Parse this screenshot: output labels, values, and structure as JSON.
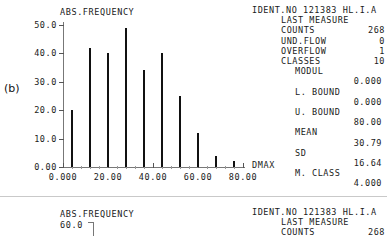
{
  "figure_label": "(b)",
  "panel_b": {
    "y_axis_title": "ABS.FREQUENCY",
    "x_axis_title": "DMAX",
    "y_ticks": [
      "50.0",
      "40.0",
      "30.0",
      "20.0",
      "10.0",
      "0.00"
    ],
    "x_ticks": [
      "0.000",
      "20.00",
      "40.00",
      "60.00",
      "80.00"
    ],
    "stats": {
      "ident_line": "IDENT.NO 121383 HL.I.A",
      "last_measure": "LAST MEASURE",
      "counts_label": "COUNTS",
      "counts_value": "268",
      "underflow_label": "UND.FLOW",
      "underflow_value": "0",
      "overflow_label": "OVERFLOW",
      "overflow_value": "1",
      "classes_label": "CLASSES",
      "classes_value": "10",
      "modul_label": "MODUL",
      "modul_value": "0.000",
      "lbound_label": "L. BOUND",
      "lbound_value": "0.000",
      "ubound_label": "U. BOUND",
      "ubound_value": "80.00",
      "mean_label": "MEAN",
      "mean_value": "30.79",
      "sd_label": "SD",
      "sd_value": "16.64",
      "mclass_label": "M. CLASS",
      "mclass_value": "4.000"
    }
  },
  "panel_c": {
    "y_axis_title": "ABS.FREQUENCY",
    "y_top_tick": "60.0",
    "stats": {
      "ident_line": "IDENT.NO 121383 HL.I.A",
      "last_measure": "LAST MEASURE",
      "counts_label": "COUNTS",
      "counts_value": "268"
    }
  },
  "chart_data": {
    "type": "bar",
    "title": "",
    "xlabel": "DMAX",
    "ylabel": "ABS.FREQUENCY",
    "categories": [
      "4.000",
      "12.00",
      "20.00",
      "28.00",
      "36.00",
      "44.00",
      "52.00",
      "60.00",
      "68.00",
      "76.00"
    ],
    "x": [
      4,
      12,
      20,
      28,
      36,
      44,
      52,
      60,
      68,
      76
    ],
    "values": [
      20,
      42,
      40,
      49,
      34,
      40,
      25,
      12,
      4,
      2
    ],
    "xlim": [
      0,
      80
    ],
    "ylim": [
      0,
      50
    ],
    "xticks": [
      0,
      20,
      40,
      60,
      80
    ],
    "xticklabels": [
      "0.000",
      "20.00",
      "40.00",
      "60.00",
      "80.00"
    ],
    "yticks": [
      0,
      10,
      20,
      30,
      40,
      50
    ],
    "yticklabels": [
      "0.00",
      "10.0",
      "20.0",
      "30.0",
      "40.0",
      "50.0"
    ],
    "grid": false,
    "legend": false,
    "bar_color": "#111111"
  }
}
